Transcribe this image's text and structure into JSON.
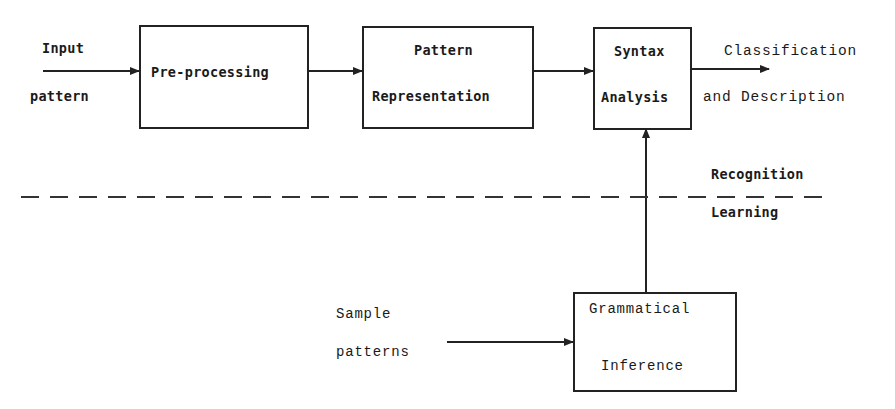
{
  "diagram": {
    "colors": {
      "ink": "#222222",
      "background": "#ffffff"
    },
    "input_label": {
      "line1": "Input",
      "line2": "pattern"
    },
    "blocks": {
      "preprocessing": {
        "line1": "Pre-processing"
      },
      "representation": {
        "line1": "Pattern",
        "line2": "Representation"
      },
      "syntax": {
        "line1": "Syntax",
        "line2": "Analysis"
      },
      "inference": {
        "line1": "Grammatical",
        "line2": "Inference"
      }
    },
    "output_label": {
      "line1": "Classification",
      "line2": "and Description"
    },
    "divider": {
      "above": "Recognition",
      "below": "Learning"
    },
    "sample_label": {
      "line1": "Sample",
      "line2": "patterns"
    },
    "connections": [
      {
        "from": "input",
        "to": "preprocessing"
      },
      {
        "from": "preprocessing",
        "to": "representation"
      },
      {
        "from": "representation",
        "to": "syntax"
      },
      {
        "from": "syntax",
        "to": "output"
      },
      {
        "from": "inference",
        "to": "syntax"
      },
      {
        "from": "sample",
        "to": "inference"
      }
    ]
  }
}
